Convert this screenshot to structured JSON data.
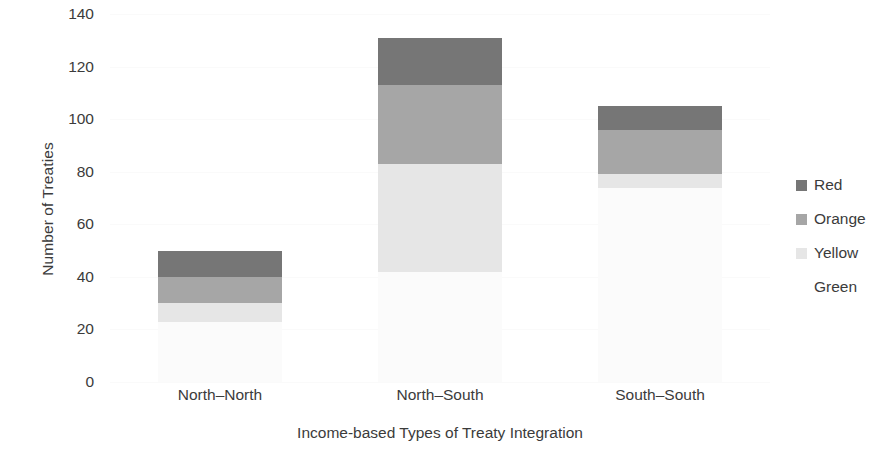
{
  "chart_data": {
    "type": "bar",
    "stacked": true,
    "title": "",
    "xlabel": "Income-based Types of Treaty Integration",
    "ylabel": "Number of Treaties",
    "categories": [
      "North–North",
      "North–South",
      "South–South"
    ],
    "series": [
      {
        "name": "Green",
        "color": "#fbfbfb",
        "values": [
          23,
          42,
          74
        ]
      },
      {
        "name": "Yellow",
        "color": "#e6e6e6",
        "values": [
          7,
          41,
          5
        ]
      },
      {
        "name": "Orange",
        "color": "#a6a6a6",
        "values": [
          10,
          30,
          17
        ]
      },
      {
        "name": "Red",
        "color": "#767676",
        "values": [
          10,
          18,
          9
        ]
      }
    ],
    "totals": [
      50,
      131,
      105
    ],
    "ylim": [
      0,
      140
    ],
    "yticks": [
      0,
      20,
      40,
      60,
      80,
      100,
      120,
      140
    ],
    "ytick_labels": [
      "0",
      "20",
      "40",
      "60",
      "80",
      "100",
      "120",
      "140"
    ],
    "grid": false,
    "legend_position": "right",
    "legend_order": [
      "Red",
      "Orange",
      "Yellow",
      "Green"
    ],
    "background": "#ffffff",
    "text_color": "#3b3b3b"
  },
  "legend": {
    "items": [
      {
        "label": "Red",
        "color": "#767676"
      },
      {
        "label": "Orange",
        "color": "#a6a6a6"
      },
      {
        "label": "Yellow",
        "color": "#e6e6e6"
      },
      {
        "label": "Green",
        "color": "#ffffff"
      }
    ]
  },
  "axes": {
    "y_title": "Number of Treaties",
    "x_title": "Income-based Types of Treaty Integration"
  }
}
